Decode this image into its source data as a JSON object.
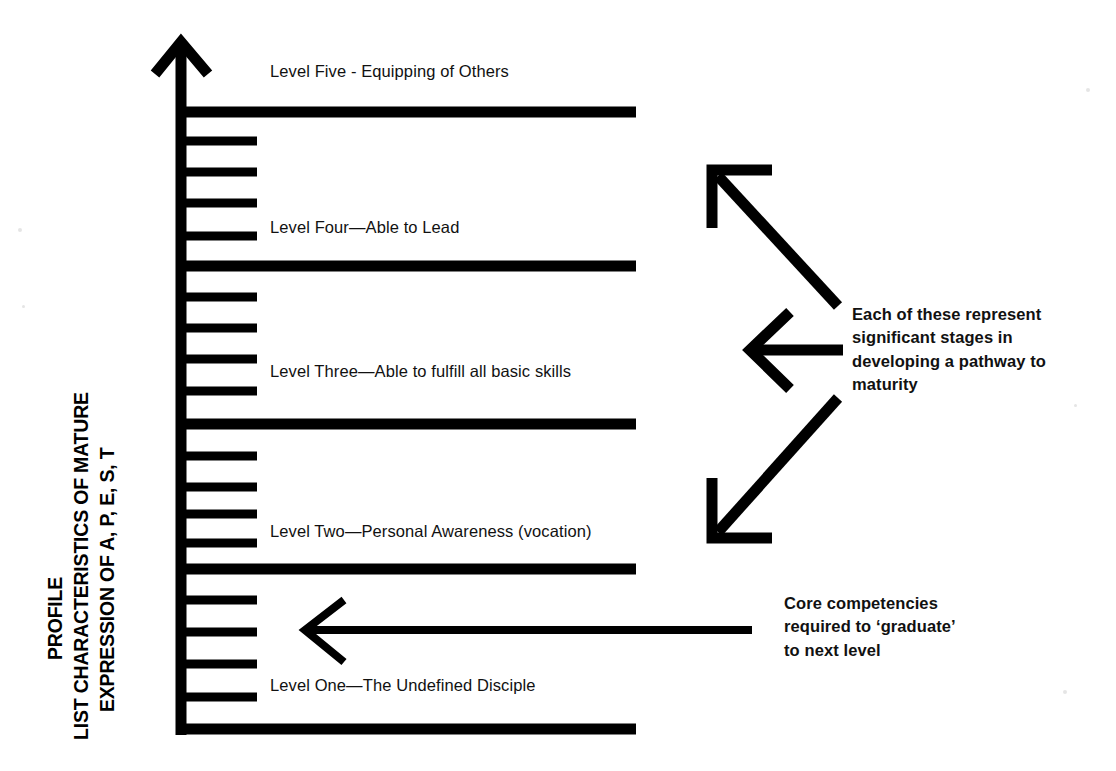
{
  "diagram": {
    "title_lines": [
      "PROFILE",
      "LIST CHARACTERISTICS OF MATURE",
      "EXPRESSION OF A, P, E, S, T"
    ],
    "axis_title_full": "PROFILE LIST CHARACTERISTICS OF MATURE EXPRESSION OF A, P, E, S, T",
    "ink_color": "#000000",
    "background_color": "#ffffff"
  },
  "levels": [
    {
      "id": "level-five",
      "label": "Level Five - Equipping of Others",
      "label_x": 270,
      "label_y": 70,
      "rule_y": 112
    },
    {
      "id": "level-four",
      "label": "Level Four—Able to Lead",
      "label_x": 270,
      "label_y": 226,
      "rule_y": 266
    },
    {
      "id": "level-three",
      "label": "Level Three—Able to fulfill all basic skills",
      "label_x": 270,
      "label_y": 371,
      "rule_y": 424
    },
    {
      "id": "level-two",
      "label": "Level Two—Personal Awareness (vocation)",
      "label_x": 270,
      "label_y": 530,
      "rule_y": 569
    },
    {
      "id": "level-one",
      "label": "Level One—The Undefined Disciple",
      "label_x": 270,
      "label_y": 684,
      "rule_y": 729
    }
  ],
  "notes": {
    "stages": "Each of these represent\nsignificant stages in\ndeveloping a pathway to\nmaturity",
    "core": "Core competencies\nrequired to ‘graduate’\nto next level"
  },
  "arrows": {
    "stages_up": {
      "name": "arrow-up-left",
      "from_x": 838,
      "from_y": 305,
      "to_x": 712,
      "to_y": 170
    },
    "stages_mid": {
      "name": "arrow-left",
      "from_x": 838,
      "from_y": 350,
      "to_x": 748,
      "to_y": 350
    },
    "stages_down": {
      "name": "arrow-down-left",
      "from_x": 838,
      "from_y": 400,
      "to_x": 712,
      "to_y": 538
    },
    "core_left": {
      "name": "arrow-left-long",
      "from_x": 752,
      "from_y": 630,
      "to_x": 305,
      "to_y": 630
    }
  },
  "axis": {
    "name": "vertical-axis-arrow",
    "x": 181,
    "top_y": 40,
    "bottom_y": 735,
    "tick_count": 22,
    "tick_spacing": 29,
    "tick_length_short": 78,
    "tick_length_long": 457
  }
}
